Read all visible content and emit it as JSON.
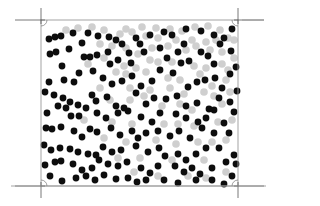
{
  "figure": {
    "type": "particle-distribution",
    "box": {
      "x1": 41,
      "y1": 20,
      "x2": 238,
      "y2": 186
    },
    "colors": {
      "black_particle": "#0d0d0d",
      "gray_particle": "#cfcfcf",
      "box_edge": "#9a9a9a",
      "crop_mark": "#555555"
    },
    "crop_marks": [
      {
        "corner": "top-left",
        "x": 41,
        "y": 20
      },
      {
        "corner": "top-right",
        "x": 238,
        "y": 20
      },
      {
        "corner": "bottom-left",
        "x": 41,
        "y": 186
      },
      {
        "corner": "bottom-right",
        "x": 238,
        "y": 186
      }
    ],
    "black_radius": 3.4,
    "gray_radius": 3.8,
    "black_particles": [
      [
        49,
        39
      ],
      [
        55,
        37
      ],
      [
        61,
        36
      ],
      [
        73,
        33
      ],
      [
        88,
        33
      ],
      [
        98,
        36
      ],
      [
        109,
        37
      ],
      [
        116,
        40
      ],
      [
        122,
        44
      ],
      [
        136,
        38
      ],
      [
        150,
        35
      ],
      [
        164,
        32
      ],
      [
        172,
        35
      ],
      [
        186,
        29
      ],
      [
        201,
        31
      ],
      [
        214,
        35
      ],
      [
        220,
        44
      ],
      [
        232,
        29
      ],
      [
        50,
        54
      ],
      [
        56,
        52
      ],
      [
        69,
        49
      ],
      [
        82,
        43
      ],
      [
        84,
        57
      ],
      [
        90,
        57
      ],
      [
        97,
        55
      ],
      [
        108,
        52
      ],
      [
        110,
        64
      ],
      [
        118,
        60
      ],
      [
        129,
        53
      ],
      [
        131,
        63
      ],
      [
        140,
        44
      ],
      [
        144,
        52
      ],
      [
        160,
        48
      ],
      [
        167,
        58
      ],
      [
        178,
        52
      ],
      [
        184,
        44
      ],
      [
        189,
        61
      ],
      [
        201,
        52
      ],
      [
        208,
        56
      ],
      [
        214,
        64
      ],
      [
        231,
        51
      ],
      [
        224,
        38
      ],
      [
        62,
        66
      ],
      [
        64,
        80
      ],
      [
        74,
        82
      ],
      [
        79,
        73
      ],
      [
        93,
        71
      ],
      [
        103,
        78
      ],
      [
        112,
        84
      ],
      [
        122,
        81
      ],
      [
        132,
        76
      ],
      [
        141,
        86
      ],
      [
        152,
        81
      ],
      [
        160,
        70
      ],
      [
        173,
        73
      ],
      [
        181,
        63
      ],
      [
        188,
        87
      ],
      [
        197,
        82
      ],
      [
        205,
        80
      ],
      [
        215,
        78
      ],
      [
        222,
        88
      ],
      [
        230,
        74
      ],
      [
        236,
        67
      ],
      [
        49,
        82
      ],
      [
        45,
        92
      ],
      [
        54,
        95
      ],
      [
        63,
        98
      ],
      [
        70,
        102
      ],
      [
        78,
        105
      ],
      [
        92,
        95
      ],
      [
        96,
        101
      ],
      [
        107,
        97
      ],
      [
        116,
        106
      ],
      [
        124,
        108
      ],
      [
        136,
        93
      ],
      [
        146,
        104
      ],
      [
        154,
        98
      ],
      [
        166,
        99
      ],
      [
        177,
        96
      ],
      [
        186,
        106
      ],
      [
        197,
        103
      ],
      [
        209,
        109
      ],
      [
        219,
        98
      ],
      [
        230,
        102
      ],
      [
        237,
        91
      ],
      [
        47,
        113
      ],
      [
        58,
        106
      ],
      [
        66,
        108
      ],
      [
        71,
        116
      ],
      [
        79,
        116
      ],
      [
        86,
        108
      ],
      [
        97,
        113
      ],
      [
        106,
        118
      ],
      [
        118,
        113
      ],
      [
        128,
        111
      ],
      [
        141,
        117
      ],
      [
        152,
        122
      ],
      [
        160,
        113
      ],
      [
        176,
        114
      ],
      [
        186,
        118
      ],
      [
        198,
        122
      ],
      [
        206,
        118
      ],
      [
        214,
        110
      ],
      [
        224,
        123
      ],
      [
        234,
        112
      ],
      [
        46,
        128
      ],
      [
        52,
        129
      ],
      [
        61,
        127
      ],
      [
        74,
        131
      ],
      [
        82,
        137
      ],
      [
        90,
        129
      ],
      [
        97,
        132
      ],
      [
        111,
        128
      ],
      [
        120,
        135
      ],
      [
        132,
        131
      ],
      [
        138,
        138
      ],
      [
        146,
        133
      ],
      [
        158,
        131
      ],
      [
        170,
        136
      ],
      [
        179,
        131
      ],
      [
        190,
        138
      ],
      [
        202,
        128
      ],
      [
        214,
        133
      ],
      [
        229,
        133
      ],
      [
        44,
        145
      ],
      [
        51,
        150
      ],
      [
        60,
        148
      ],
      [
        70,
        149
      ],
      [
        78,
        152
      ],
      [
        88,
        154
      ],
      [
        96,
        155
      ],
      [
        103,
        147
      ],
      [
        112,
        152
      ],
      [
        121,
        150
      ],
      [
        136,
        146
      ],
      [
        148,
        152
      ],
      [
        159,
        148
      ],
      [
        165,
        156
      ],
      [
        178,
        154
      ],
      [
        186,
        160
      ],
      [
        196,
        154
      ],
      [
        206,
        148
      ],
      [
        219,
        148
      ],
      [
        234,
        155
      ],
      [
        45,
        165
      ],
      [
        55,
        162
      ],
      [
        61,
        161
      ],
      [
        73,
        164
      ],
      [
        82,
        170
      ],
      [
        92,
        168
      ],
      [
        99,
        160
      ],
      [
        108,
        164
      ],
      [
        118,
        166
      ],
      [
        127,
        162
      ],
      [
        141,
        168
      ],
      [
        150,
        173
      ],
      [
        158,
        166
      ],
      [
        175,
        166
      ],
      [
        184,
        172
      ],
      [
        192,
        168
      ],
      [
        200,
        174
      ],
      [
        212,
        168
      ],
      [
        226,
        162
      ],
      [
        236,
        164
      ],
      [
        50,
        176
      ],
      [
        62,
        181
      ],
      [
        76,
        178
      ],
      [
        86,
        176
      ],
      [
        95,
        180
      ],
      [
        104,
        175
      ],
      [
        116,
        179
      ],
      [
        128,
        178
      ],
      [
        137,
        182
      ],
      [
        146,
        180
      ],
      [
        164,
        180
      ],
      [
        178,
        183
      ],
      [
        196,
        180
      ],
      [
        212,
        180
      ],
      [
        224,
        184
      ],
      [
        232,
        176
      ]
    ],
    "gray_particles": [
      [
        66,
        30
      ],
      [
        78,
        28
      ],
      [
        92,
        27
      ],
      [
        104,
        30
      ],
      [
        126,
        29
      ],
      [
        142,
        27
      ],
      [
        156,
        28
      ],
      [
        170,
        29
      ],
      [
        182,
        31
      ],
      [
        195,
        27
      ],
      [
        208,
        26
      ],
      [
        220,
        30
      ],
      [
        228,
        38
      ],
      [
        120,
        34
      ],
      [
        132,
        32
      ],
      [
        146,
        36
      ],
      [
        158,
        38
      ],
      [
        176,
        40
      ],
      [
        192,
        40
      ],
      [
        206,
        42
      ],
      [
        216,
        40
      ],
      [
        234,
        40
      ],
      [
        100,
        44
      ],
      [
        112,
        46
      ],
      [
        126,
        48
      ],
      [
        138,
        54
      ],
      [
        152,
        48
      ],
      [
        168,
        46
      ],
      [
        186,
        50
      ],
      [
        196,
        46
      ],
      [
        210,
        50
      ],
      [
        222,
        52
      ],
      [
        234,
        58
      ],
      [
        104,
        58
      ],
      [
        124,
        66
      ],
      [
        136,
        68
      ],
      [
        150,
        60
      ],
      [
        158,
        62
      ],
      [
        172,
        62
      ],
      [
        194,
        66
      ],
      [
        206,
        68
      ],
      [
        222,
        64
      ],
      [
        228,
        70
      ],
      [
        88,
        64
      ],
      [
        116,
        72
      ],
      [
        126,
        74
      ],
      [
        146,
        72
      ],
      [
        168,
        78
      ],
      [
        180,
        80
      ],
      [
        200,
        74
      ],
      [
        212,
        86
      ],
      [
        226,
        80
      ],
      [
        100,
        88
      ],
      [
        130,
        88
      ],
      [
        150,
        90
      ],
      [
        170,
        88
      ],
      [
        184,
        94
      ],
      [
        204,
        92
      ],
      [
        214,
        96
      ],
      [
        230,
        92
      ],
      [
        110,
        100
      ],
      [
        130,
        100
      ],
      [
        144,
        96
      ],
      [
        162,
        106
      ],
      [
        180,
        104
      ],
      [
        192,
        110
      ],
      [
        222,
        104
      ],
      [
        232,
        120
      ],
      [
        84,
        120
      ],
      [
        112,
        122
      ],
      [
        132,
        124
      ],
      [
        164,
        124
      ],
      [
        178,
        124
      ],
      [
        194,
        126
      ],
      [
        218,
        122
      ],
      [
        104,
        138
      ],
      [
        126,
        142
      ],
      [
        156,
        140
      ],
      [
        176,
        144
      ],
      [
        198,
        142
      ],
      [
        212,
        142
      ],
      [
        226,
        140
      ],
      [
        118,
        158
      ],
      [
        140,
        158
      ],
      [
        172,
        160
      ],
      [
        204,
        160
      ],
      [
        226,
        172
      ],
      [
        134,
        172
      ],
      [
        158,
        176
      ],
      [
        188,
        176
      ],
      [
        206,
        178
      ]
    ]
  }
}
